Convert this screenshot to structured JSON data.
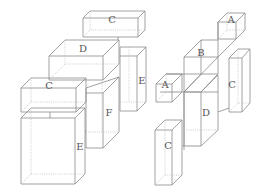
{
  "diagram": {
    "title": "",
    "left_structure": {
      "boxes": [
        {
          "label": "C",
          "role": "top-flat-box"
        },
        {
          "label": "D",
          "role": "upper-flat-box"
        },
        {
          "label": "E",
          "role": "tall-right-box"
        },
        {
          "label": "C",
          "role": "middle-flat-box"
        },
        {
          "label": "F",
          "role": "tall-center-box"
        },
        {
          "label": "E",
          "role": "large-cube"
        }
      ]
    },
    "right_structure": {
      "boxes": [
        {
          "label": "A",
          "role": "top-small-cube"
        },
        {
          "label": "B",
          "role": "center-column"
        },
        {
          "label": "A",
          "role": "left-small-cube"
        },
        {
          "label": "C",
          "role": "tall-right-box"
        },
        {
          "label": "D",
          "role": "center-tall-box"
        },
        {
          "label": "C",
          "role": "bottom-tall-box"
        }
      ]
    }
  }
}
